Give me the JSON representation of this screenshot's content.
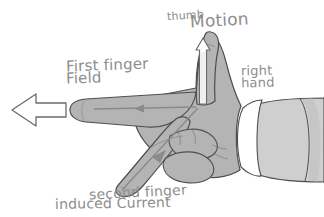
{
  "figure": {
    "background_color": "#ffffff",
    "width": 324,
    "height": 217
  },
  "colors": {
    "hand_fill": "#b4b4b4",
    "hand_outline": "#4f4f4f",
    "sleeve_fill": "#cfcfcf",
    "cuff_fill": "#ffffff",
    "label_text": "#8d8d8d",
    "arrow_outline": "#6b6b6b",
    "arrow_fill": "#ffffff",
    "inner_arrow": "#8a8a8a"
  },
  "labels": {
    "motion": "Motion",
    "thumb": "thumb",
    "first_finger": "First finger",
    "field": "Field",
    "right_hand_line1": "right",
    "right_hand_line2": "hand",
    "second_finger": "second finger",
    "induced_current": "induced Current"
  },
  "arrows": {
    "field_big": {
      "name": "field-block-arrow",
      "direction": "left",
      "style": "white outlined block arrow"
    },
    "motion_thumb": {
      "name": "motion-arrow",
      "direction": "up",
      "style": "thin outlined shaft with arrowhead"
    },
    "field_finger": {
      "name": "field-finger-arrow",
      "direction": "left",
      "style": "thin line with mid arrowhead"
    },
    "current_finger": {
      "name": "current-finger-arrow",
      "direction": "down-left",
      "style": "thin line with arrowhead"
    }
  }
}
